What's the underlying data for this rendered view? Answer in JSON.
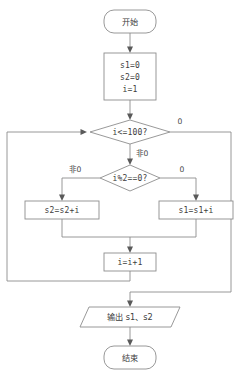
{
  "diagram": {
    "colors": {
      "background": "#ffffff",
      "shape_stroke": "#8d8d8d",
      "shape_fill": "#ffffff",
      "text": "#3d3d3d",
      "connector": "#8d8d8d",
      "arrowhead": "#5a5a5a"
    },
    "nodes": {
      "start": {
        "label": "开始",
        "shape": "terminator"
      },
      "init": {
        "shape": "process",
        "lines": [
          "s1=0",
          "s2=0",
          "i=1"
        ],
        "line1": "s1=0",
        "line2": "s2=0",
        "line3": "i=1"
      },
      "loop_condition": {
        "label": "i<=100?",
        "shape": "decision"
      },
      "parity_condition": {
        "label": "i%2==0?",
        "shape": "decision"
      },
      "even_branch": {
        "label": "s2=s2+i",
        "shape": "process"
      },
      "odd_branch": {
        "label": "s1=s1+i",
        "shape": "process"
      },
      "increment": {
        "label": "i=i+1",
        "shape": "process"
      },
      "output": {
        "label": "输出 s1、s2",
        "shape": "parallelogram"
      },
      "end": {
        "label": "结束",
        "shape": "terminator"
      }
    },
    "edge_labels": {
      "loop_false": "0",
      "loop_true": "非0",
      "parity_true": "非0",
      "parity_false": "0"
    }
  }
}
